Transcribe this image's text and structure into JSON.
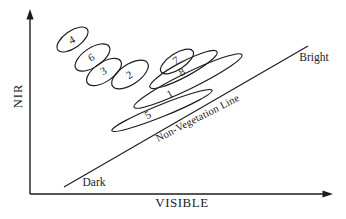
{
  "colors": {
    "ink": "#1c1c1c",
    "background": "#ffffff"
  },
  "axes": {
    "y_label": "NIR",
    "x_label": "VISIBLE"
  },
  "annotations": {
    "dark": "Dark",
    "bright": "Bright",
    "line_label": "Non-Vegetation Line"
  },
  "diagram": {
    "type": "class-cluster-scatter-diagram",
    "number_rotation": -30,
    "line": {
      "x1": 64,
      "y1": 187,
      "x2": 308,
      "y2": 46
    },
    "ellipses": [
      {
        "label": "4",
        "cx": 72.5,
        "cy": 39.5,
        "rx": 18,
        "ry": 8.5,
        "rotation": -35,
        "lx": 72,
        "ly": 40
      },
      {
        "label": "6",
        "cx": 92.5,
        "cy": 57.5,
        "rx": 20,
        "ry": 9.5,
        "rotation": -34,
        "lx": 91.5,
        "ly": 57.5
      },
      {
        "label": "3",
        "cx": 104,
        "cy": 72,
        "rx": 20,
        "ry": 9.5,
        "rotation": -34,
        "lx": 103.5,
        "ly": 71
      },
      {
        "label": "2",
        "cx": 130,
        "cy": 74.5,
        "rx": 21,
        "ry": 10,
        "rotation": -34,
        "lx": 129.5,
        "ly": 75
      },
      {
        "label": "7",
        "cx": 177,
        "cy": 61.5,
        "rx": 19,
        "ry": 8,
        "rotation": -33,
        "lx": 176,
        "ly": 60.5
      },
      {
        "label": "8",
        "cx": 183.5,
        "cy": 69.5,
        "rx": 38,
        "ry": 7.5,
        "rotation": -28,
        "lx": 182,
        "ly": 72
      },
      {
        "label": "1",
        "cx": 188,
        "cy": 81,
        "rx": 60,
        "ry": 8,
        "rotation": -26,
        "lx": 170,
        "ly": 94
      },
      {
        "label": "5",
        "cx": 162,
        "cy": 110.5,
        "rx": 54,
        "ry": 6,
        "rotation": -22,
        "lx": 148,
        "ly": 115
      }
    ]
  }
}
